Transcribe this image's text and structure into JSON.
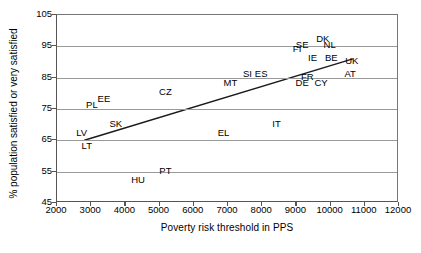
{
  "chart_data": {
    "type": "scatter",
    "title": "",
    "xlabel": "Poverty risk threshold in PPS",
    "ylabel": "% population satisfied or very satisfied",
    "xlim": [
      2000,
      12000
    ],
    "ylim": [
      45,
      105
    ],
    "xticks": [
      2000,
      3000,
      4000,
      5000,
      6000,
      7000,
      8000,
      9000,
      10000,
      11000,
      12000
    ],
    "yticks": [
      45,
      55,
      65,
      75,
      85,
      95,
      105
    ],
    "grid": "horizontal",
    "legend": "none",
    "point_style": "text-label-only",
    "points": [
      {
        "label": "LT",
        "x": 2900,
        "y": 63
      },
      {
        "label": "LV",
        "x": 2750,
        "y": 67
      },
      {
        "label": "PL",
        "x": 3050,
        "y": 76
      },
      {
        "label": "EE",
        "x": 3400,
        "y": 78
      },
      {
        "label": "SK",
        "x": 3750,
        "y": 70
      },
      {
        "label": "HU",
        "x": 4400,
        "y": 52
      },
      {
        "label": "CZ",
        "x": 5200,
        "y": 80
      },
      {
        "label": "PT",
        "x": 5200,
        "y": 55
      },
      {
        "label": "EL",
        "x": 6900,
        "y": 67
      },
      {
        "label": "MT",
        "x": 7100,
        "y": 83
      },
      {
        "label": "SI",
        "x": 7600,
        "y": 86
      },
      {
        "label": "ES",
        "x": 8000,
        "y": 86
      },
      {
        "label": "IT",
        "x": 8450,
        "y": 70
      },
      {
        "label": "FI",
        "x": 9050,
        "y": 94
      },
      {
        "label": "SE",
        "x": 9200,
        "y": 95
      },
      {
        "label": "DE",
        "x": 9200,
        "y": 83
      },
      {
        "label": "FR",
        "x": 9350,
        "y": 85
      },
      {
        "label": "IE",
        "x": 9500,
        "y": 91
      },
      {
        "label": "DK",
        "x": 9800,
        "y": 97
      },
      {
        "label": "CY",
        "x": 9750,
        "y": 83
      },
      {
        "label": "NL",
        "x": 10000,
        "y": 95
      },
      {
        "label": "BE",
        "x": 10050,
        "y": 91
      },
      {
        "label": "UK",
        "x": 10650,
        "y": 90
      },
      {
        "label": "AT",
        "x": 10600,
        "y": 86
      }
    ],
    "trendline": {
      "x_start": 2800,
      "y_start": 65,
      "x_end": 10650,
      "y_end": 91,
      "color": "#1a1a1a"
    },
    "colors": {
      "axis": "#555555",
      "grid": "#9a9a9a",
      "text": "#000000",
      "trend": "#1a1a1a",
      "background": "#ffffff"
    }
  }
}
